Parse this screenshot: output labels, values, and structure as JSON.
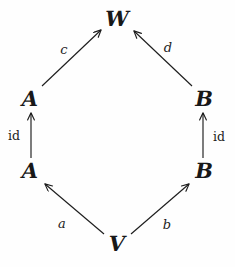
{
  "diagram": {
    "kind": "commutative-diagram",
    "background_color": "#fefefe",
    "ink_color": "#1d1d1d",
    "nodes": [
      {
        "id": "W",
        "label": "W",
        "x": 117,
        "y": 18
      },
      {
        "id": "A_top",
        "label": "A",
        "x": 30,
        "y": 98
      },
      {
        "id": "B_top",
        "label": "B",
        "x": 204,
        "y": 98
      },
      {
        "id": "A_bottom",
        "label": "A",
        "x": 30,
        "y": 170
      },
      {
        "id": "B_bottom",
        "label": "B",
        "x": 204,
        "y": 170
      },
      {
        "id": "V",
        "label": "V",
        "x": 117,
        "y": 243
      }
    ],
    "edges": [
      {
        "id": "c",
        "label": "c",
        "from": "A_top",
        "to": "W",
        "label_x": 64,
        "label_y": 49,
        "upright": false
      },
      {
        "id": "d",
        "label": "d",
        "from": "B_top",
        "to": "W",
        "label_x": 168,
        "label_y": 47,
        "upright": false
      },
      {
        "id": "id_left",
        "label": "id",
        "from": "A_bottom",
        "to": "A_top",
        "label_x": 14,
        "label_y": 136,
        "upright": true
      },
      {
        "id": "id_right",
        "label": "id",
        "from": "B_bottom",
        "to": "B_top",
        "label_x": 219,
        "label_y": 137,
        "upright": true
      },
      {
        "id": "a",
        "label": "a",
        "from": "V",
        "to": "A_bottom",
        "label_x": 62,
        "label_y": 223,
        "upright": false
      },
      {
        "id": "b",
        "label": "b",
        "from": "V",
        "to": "B_bottom",
        "label_x": 167,
        "label_y": 224,
        "upright": false
      }
    ]
  }
}
